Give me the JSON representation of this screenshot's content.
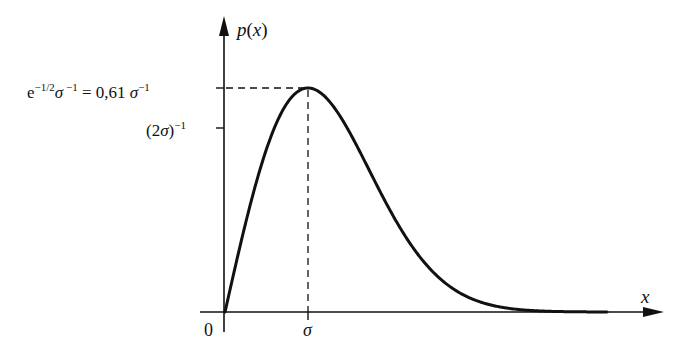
{
  "chart_data": {
    "type": "line",
    "title": "",
    "function": "Rayleigh density p(x) = (x/σ²)·exp(−x²/(2σ²))",
    "xlabel": "x",
    "ylabel": "p(x)",
    "x_ticks": [
      {
        "label": "0",
        "value": 0
      },
      {
        "label": "σ",
        "value": 1
      }
    ],
    "y_ticks": [
      {
        "label": "e^{-1/2} σ^{-1} = 0,61 σ^{-1}",
        "value": 0.61
      },
      {
        "label": "(2σ)^{-1}",
        "value": 0.5
      }
    ],
    "series": [
      {
        "name": "p(x)",
        "x_in_sigma": [
          0,
          0.25,
          0.5,
          0.75,
          1.0,
          1.25,
          1.5,
          1.75,
          2.0,
          2.5,
          3.0,
          3.5,
          4.0,
          4.6
        ],
        "values_in_inv_sigma": [
          0,
          0.242,
          0.441,
          0.567,
          0.607,
          0.572,
          0.487,
          0.379,
          0.271,
          0.11,
          0.033,
          0.008,
          0.001,
          0.0001
        ]
      }
    ],
    "annotations": [
      "dashed horizontal line from y-axis to peak at height 0,61 σ⁻¹",
      "dashed vertical line from peak down to x = σ"
    ],
    "grid": false,
    "legend": "none",
    "xlim": [
      0,
      5.2
    ],
    "ylim": [
      0,
      0.75
    ]
  },
  "labels": {
    "ylabel_p": "p",
    "ylabel_open": "(",
    "ylabel_x": "x",
    "ylabel_close": ")",
    "xlabel": "x",
    "origin": "0",
    "sigma_tick": "σ",
    "peak_e": "e",
    "peak_exp1": "−1/2",
    "peak_sigma": "σ",
    "peak_exp2": " −1",
    "peak_eq": " = 0,61 ",
    "peak_sigma2": "σ",
    "peak_exp3": "−1",
    "half_open": "(2",
    "half_sigma": "σ",
    "half_close": ")",
    "half_exp": "−1"
  },
  "style": {
    "ink": "#111111",
    "background": "#ffffff"
  }
}
